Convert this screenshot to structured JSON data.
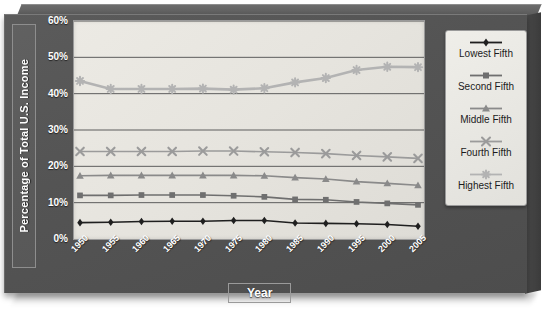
{
  "yaxis_title": "Percentage of Total U.S. Income",
  "xaxis_title": "Year",
  "legend": {
    "items": [
      {
        "label": "Lowest Fifth",
        "marker": "diamond-marker-icon",
        "color": "#1f1f1f"
      },
      {
        "label": "Second Fifth",
        "marker": "square-marker-icon",
        "color": "#6f6f6f"
      },
      {
        "label": "Middle Fifth",
        "marker": "triangle-marker-icon",
        "color": "#8a8a8a"
      },
      {
        "label": "Fourth Fifth",
        "marker": "cross-marker-icon",
        "color": "#9b9b9b"
      },
      {
        "label": "Highest Fifth",
        "marker": "star-marker-icon",
        "color": "#b3b3b3"
      }
    ]
  },
  "ytick_labels": [
    "0%",
    "10%",
    "20%",
    "30%",
    "40%",
    "50%",
    "60%"
  ],
  "chart_data": {
    "type": "line",
    "title": "",
    "xlabel": "Year",
    "ylabel": "Percentage of Total U.S. Income",
    "categories": [
      "1950",
      "1955",
      "1960",
      "1965",
      "1970",
      "1975",
      "1980",
      "1985",
      "1990",
      "1995",
      "2000",
      "2005"
    ],
    "ylim": [
      0,
      60
    ],
    "yticks": [
      0,
      10,
      20,
      30,
      40,
      50,
      60
    ],
    "ytick_format": "percent",
    "grid": "horizontal",
    "legend_position": "right",
    "series": [
      {
        "name": "Lowest Fifth",
        "marker": "diamond",
        "color": "#1f1f1f",
        "values": [
          4.5,
          4.6,
          4.8,
          4.9,
          4.9,
          5.1,
          5.1,
          4.4,
          4.3,
          4.2,
          4.0,
          3.5
        ]
      },
      {
        "name": "Second Fifth",
        "marker": "square",
        "color": "#6f6f6f",
        "values": [
          12.0,
          12.0,
          12.1,
          12.1,
          12.1,
          11.9,
          11.6,
          10.9,
          10.8,
          10.2,
          9.8,
          9.4
        ]
      },
      {
        "name": "Middle Fifth",
        "marker": "triangle",
        "color": "#8a8a8a",
        "values": [
          17.4,
          17.5,
          17.5,
          17.5,
          17.5,
          17.5,
          17.4,
          16.9,
          16.5,
          15.8,
          15.3,
          14.8
        ]
      },
      {
        "name": "Fourth Fifth",
        "marker": "cross",
        "color": "#9b9b9b",
        "values": [
          24.1,
          24.1,
          24.1,
          24.1,
          24.2,
          24.2,
          24.0,
          23.8,
          23.5,
          23.0,
          22.6,
          22.2
        ]
      },
      {
        "name": "Highest Fifth",
        "marker": "star",
        "color": "#b3b3b3",
        "values": [
          43.5,
          41.3,
          41.3,
          41.3,
          41.4,
          41.1,
          41.5,
          43.1,
          44.3,
          46.5,
          47.4,
          47.3
        ]
      }
    ]
  }
}
